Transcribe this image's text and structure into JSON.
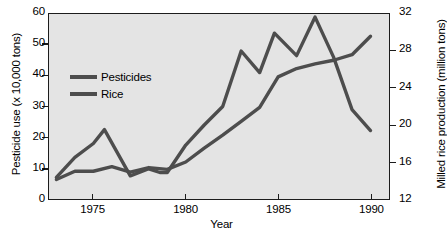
{
  "chart_data": {
    "type": "line",
    "title": "",
    "xlabel": "Year",
    "ylabel": "Pesticide use (x 10,000 tons)",
    "ylabel_right": "Milled rice production (million tons)",
    "grid": false,
    "legend_position": "upper-left",
    "xlim": [
      1972.6,
      1991.0
    ],
    "ylim": [
      0,
      60
    ],
    "ylim_right": [
      12,
      32
    ],
    "xticks": [
      1975,
      1980,
      1985,
      1990
    ],
    "xticklabels": [
      "1975",
      "1980",
      "1985",
      "1990"
    ],
    "yticks": [
      0,
      10,
      20,
      30,
      40,
      50,
      60
    ],
    "yticklabels": [
      "0",
      "10",
      "20",
      "30",
      "40",
      "50",
      "60"
    ],
    "yticks_right": [
      12,
      16,
      20,
      24,
      28,
      32
    ],
    "yticklabels_right": [
      "12",
      "16",
      "20",
      "24",
      "28",
      "32"
    ],
    "line_color": "#4d4d4d",
    "background_color": "#e4e4e4",
    "axis_color": "#1c1c1c",
    "series": [
      {
        "name": "Pesticides",
        "axis": "left",
        "units": "x 10,000 tons",
        "x": [
          1973,
          1974,
          1975,
          1975.6,
          1977,
          1978,
          1978.6,
          1979,
          1980,
          1981,
          1982,
          1983,
          1984,
          1984.8,
          1986,
          1987,
          1988,
          1989,
          1990
        ],
        "values": [
          7.0,
          13.5,
          18.0,
          22.5,
          7.5,
          9.8,
          8.6,
          8.6,
          17.5,
          24.0,
          30.0,
          48.0,
          41.0,
          53.8,
          46.5,
          59.0,
          46.0,
          29.0,
          22.2
        ]
      },
      {
        "name": "Rice",
        "axis": "right",
        "units": "million tons",
        "x": [
          1973,
          1974,
          1975,
          1976,
          1977,
          1978,
          1979,
          1980,
          1981,
          1982,
          1983,
          1984,
          1985,
          1986,
          1987,
          1988,
          1989,
          1990
        ],
        "values": [
          14.1,
          15.0,
          15.0,
          15.5,
          14.9,
          15.4,
          15.2,
          16.0,
          17.5,
          18.9,
          20.4,
          21.9,
          25.2,
          26.1,
          26.6,
          27.0,
          27.6,
          29.6
        ],
        "values_left_scale": [
          7.0,
          9.6,
          9.6,
          11.2,
          10.0,
          11.0,
          10.6,
          12.2,
          16.5,
          20.5,
          24.9,
          29.4,
          39.9,
          42.5,
          44.2,
          45.5,
          47.5,
          53.2
        ]
      }
    ]
  },
  "axes": {
    "left": {
      "title": "Pesticide use (x 10,000 tons)",
      "ticks": [
        "60",
        "50",
        "40",
        "30",
        "20",
        "10",
        "0"
      ]
    },
    "right": {
      "title": "Milled rice production (million tons)",
      "ticks": [
        "32",
        "28",
        "24",
        "20",
        "16",
        "12"
      ]
    },
    "bottom": {
      "title": "Year",
      "ticks": [
        "1975",
        "1980",
        "1985",
        "1990"
      ]
    }
  },
  "legend": {
    "items": [
      {
        "label": "Pesticides",
        "color": "#4d4d4d"
      },
      {
        "label": "Rice",
        "color": "#4d4d4d"
      }
    ]
  }
}
